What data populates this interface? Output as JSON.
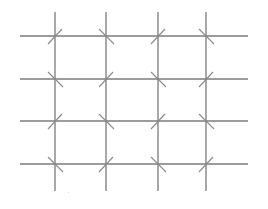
{
  "diagram": {
    "type": "grid-with-diagonal-ticks",
    "background": "#ffffff",
    "horizontal_lines": {
      "color": "#3a3a3a",
      "width": 1.2,
      "x_start": 20,
      "x_end": 248,
      "y": [
        36,
        79,
        121,
        164
      ]
    },
    "vertical_lines": {
      "color": "#7a7a7a",
      "width": 1.3,
      "y_start": 12,
      "y_end": 191,
      "x": [
        55,
        106,
        158,
        206
      ]
    },
    "diagonal_ticks": {
      "color": "#8a8a8a",
      "width": 1.1,
      "half_length": 8,
      "orientations": [
        [
          "/",
          "\\",
          "/",
          "\\"
        ],
        [
          "\\",
          "/",
          "\\",
          "/"
        ],
        [
          "/",
          "\\",
          "/",
          "\\"
        ],
        [
          "\\",
          "/",
          "\\",
          "/"
        ]
      ]
    }
  }
}
